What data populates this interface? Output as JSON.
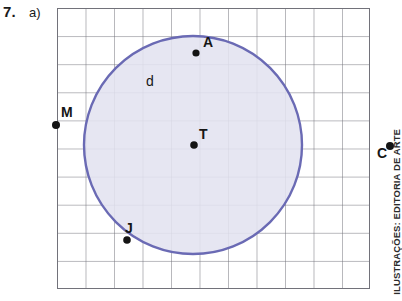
{
  "exercise": {
    "number": "7.",
    "item": "a)"
  },
  "credit": {
    "text": "ILUSTRAÇÕES: EDITORIA DE ARTE"
  },
  "figure": {
    "grid": {
      "left": 57,
      "top": 8,
      "width": 313,
      "height": 281,
      "cols": 11,
      "rows": 10,
      "cell_width": 28.5,
      "cell_height": 28.1,
      "line_color": "#6e6e72",
      "background": "#ffffff"
    },
    "circle": {
      "center_x": 193,
      "center_y": 145,
      "radius": 109,
      "stroke_color": "#6a6ab4",
      "stroke_width": 2.4,
      "fill_color": "#e2e2ef",
      "label": "d",
      "label_x": 146,
      "label_y": 75
    },
    "points": [
      {
        "name": "A",
        "x": 196,
        "y": 53,
        "label": "A",
        "label_dx": 8,
        "label_dy": -18,
        "on": "circle-interior"
      },
      {
        "name": "T",
        "x": 194,
        "y": 145,
        "label": "T",
        "label_dx": 4,
        "label_dy": -19,
        "on": "center"
      },
      {
        "name": "J",
        "x": 127,
        "y": 240,
        "label": "J",
        "label_dx": -2,
        "label_dy": -20,
        "on": "circle"
      },
      {
        "name": "M",
        "x": 57,
        "y": 124,
        "label": "M",
        "label_dx": 7,
        "label_dy": -19,
        "on": "exterior-left"
      },
      {
        "name": "C",
        "x": 390,
        "y": 147,
        "label": "C",
        "label_dx": -10,
        "label_dy": 2,
        "on": "exterior-right"
      }
    ]
  }
}
